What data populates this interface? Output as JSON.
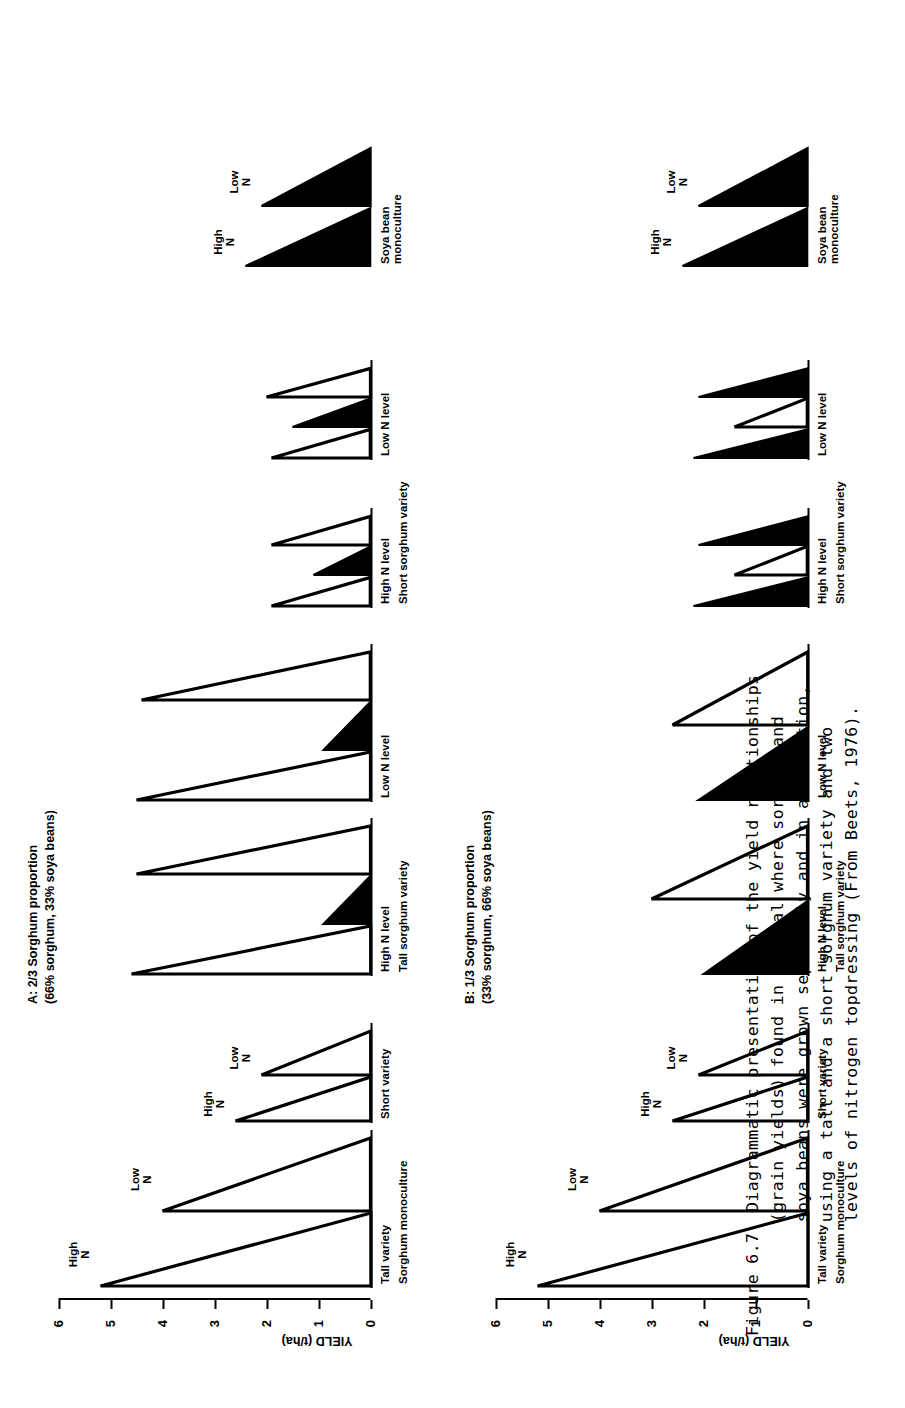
{
  "figure": {
    "number": "Figure 6.7",
    "caption_lines": [
      "Diagrammatic presentation of the yield relationships",
      "(grain yields) found in a trial where sorghum and",
      "soya beans were grown separately and in association,",
      "using a tall and a short sorghum variety and two",
      "levels of nitrogen topdressing (From Beets, 1976)."
    ]
  },
  "axis": {
    "title": "YIELD (t/ha)",
    "ticks": [
      "6",
      "5",
      "4",
      "3",
      "2",
      "1",
      "0"
    ],
    "min": 0,
    "max": 6
  },
  "nitrogen": {
    "high": "High\nN",
    "low": "Low\nN"
  },
  "panels": [
    {
      "id": "A",
      "title_line1": "A: 2/3 Sorghum proportion",
      "title_line2": "(66% sorghum, 33% soya beans)",
      "monoculture_label": "Sorghum monoculture",
      "soyabean_label": "Soya bean\nmonoculture",
      "clusters": [
        {
          "name": "sorghum-monoculture-tall",
          "label": "Tall variety",
          "group_label": "Sorghum monoculture",
          "bars": [
            {
              "crop": "sorghum",
              "n": "High",
              "value": 5.2,
              "fill": "open"
            },
            {
              "crop": "sorghum",
              "n": "Low",
              "value": 4.0,
              "fill": "open"
            }
          ]
        },
        {
          "name": "sorghum-monoculture-short",
          "label": "Short variety",
          "bars": [
            {
              "crop": "sorghum",
              "n": "High",
              "value": 2.6,
              "fill": "open"
            },
            {
              "crop": "sorghum",
              "n": "Low",
              "value": 2.1,
              "fill": "open"
            }
          ]
        },
        {
          "name": "tall-sorghum-high-n",
          "label": "High N level",
          "group_label": "Tall sorghum variety",
          "bars": [
            {
              "crop": "sorghum",
              "n": "High",
              "value": 4.6,
              "fill": "open"
            },
            {
              "crop": "soya",
              "n": "High",
              "value": 0.9,
              "fill": "solid"
            },
            {
              "crop": "sorghum",
              "n": "High",
              "value": 4.5,
              "fill": "open"
            }
          ]
        },
        {
          "name": "tall-sorghum-low-n",
          "label": "Low N level",
          "bars": [
            {
              "crop": "sorghum",
              "n": "Low",
              "value": 4.5,
              "fill": "open"
            },
            {
              "crop": "soya",
              "n": "Low",
              "value": 0.9,
              "fill": "solid"
            },
            {
              "crop": "sorghum",
              "n": "Low",
              "value": 4.4,
              "fill": "open"
            }
          ]
        },
        {
          "name": "short-sorghum-high-n",
          "label": "High N level",
          "group_label": "Short sorghum variety",
          "bars": [
            {
              "crop": "sorghum",
              "n": "High",
              "value": 1.9,
              "fill": "open"
            },
            {
              "crop": "soya",
              "n": "High",
              "value": 1.1,
              "fill": "solid"
            },
            {
              "crop": "sorghum",
              "n": "High",
              "value": 1.9,
              "fill": "open"
            }
          ]
        },
        {
          "name": "short-sorghum-low-n",
          "label": "Low N level",
          "bars": [
            {
              "crop": "sorghum",
              "n": "Low",
              "value": 1.9,
              "fill": "open"
            },
            {
              "crop": "soya",
              "n": "Low",
              "value": 1.5,
              "fill": "solid"
            },
            {
              "crop": "sorghum",
              "n": "Low",
              "value": 2.0,
              "fill": "open"
            }
          ]
        },
        {
          "name": "soya-bean-monoculture",
          "label": "Soya bean\nmonoculture",
          "bars": [
            {
              "crop": "soya",
              "n": "High",
              "value": 2.4,
              "fill": "solid"
            },
            {
              "crop": "soya",
              "n": "Low",
              "value": 2.1,
              "fill": "solid"
            }
          ]
        }
      ]
    },
    {
      "id": "B",
      "title_line1": "B: 1/3 Sorghum proportion",
      "title_line2": "(33% sorghum, 66% soya beans)",
      "monoculture_label": "Sorghum monoculture",
      "soyabean_label": "Soya bean\nmonoculture",
      "clusters": [
        {
          "name": "sorghum-monoculture-tall",
          "label": "Tall variety",
          "group_label": "Sorghum monoculture",
          "bars": [
            {
              "crop": "sorghum",
              "n": "High",
              "value": 5.2,
              "fill": "open"
            },
            {
              "crop": "sorghum",
              "n": "Low",
              "value": 4.0,
              "fill": "open"
            }
          ]
        },
        {
          "name": "sorghum-monoculture-short",
          "label": "Short variety",
          "bars": [
            {
              "crop": "sorghum",
              "n": "High",
              "value": 2.6,
              "fill": "open"
            },
            {
              "crop": "sorghum",
              "n": "Low",
              "value": 2.1,
              "fill": "open"
            }
          ]
        },
        {
          "name": "tall-sorghum-high-n",
          "label": "High N level",
          "group_label": "Tall sorghum variety",
          "bars": [
            {
              "crop": "soya",
              "n": "High",
              "value": 2.0,
              "fill": "solid"
            },
            {
              "crop": "sorghum",
              "n": "High",
              "value": 3.0,
              "fill": "open"
            }
          ]
        },
        {
          "name": "tall-sorghum-low-n",
          "label": "Low N level",
          "bars": [
            {
              "crop": "soya",
              "n": "Low",
              "value": 2.1,
              "fill": "solid"
            },
            {
              "crop": "sorghum",
              "n": "Low",
              "value": 2.6,
              "fill": "open"
            }
          ]
        },
        {
          "name": "short-sorghum-high-n",
          "label": "High N level",
          "group_label": "Short sorghum variety",
          "bars": [
            {
              "crop": "soya",
              "n": "High",
              "value": 2.2,
              "fill": "solid"
            },
            {
              "crop": "sorghum",
              "n": "High",
              "value": 1.4,
              "fill": "open"
            },
            {
              "crop": "soya",
              "n": "High",
              "value": 2.1,
              "fill": "solid"
            }
          ]
        },
        {
          "name": "short-sorghum-low-n",
          "label": "Low N level",
          "bars": [
            {
              "crop": "soya",
              "n": "Low",
              "value": 2.2,
              "fill": "solid"
            },
            {
              "crop": "sorghum",
              "n": "Low",
              "value": 1.4,
              "fill": "open"
            },
            {
              "crop": "soya",
              "n": "Low",
              "value": 2.1,
              "fill": "solid"
            }
          ]
        },
        {
          "name": "soya-bean-monoculture",
          "label": "Soya bean\nmonoculture",
          "bars": [
            {
              "crop": "soya",
              "n": "High",
              "value": 2.4,
              "fill": "solid"
            },
            {
              "crop": "soya",
              "n": "Low",
              "value": 2.1,
              "fill": "solid"
            }
          ]
        }
      ]
    }
  ],
  "chart_data": {
    "type": "bar",
    "ylabel": "YIELD (t/ha)",
    "xlabel": "",
    "ylim": [
      0,
      6
    ],
    "ytick_labels": [
      "0",
      "1",
      "2",
      "3",
      "4",
      "5",
      "6"
    ],
    "grid": false,
    "legend": [
      "open wedge = sorghum",
      "solid wedge = soya bean"
    ],
    "panels": [
      {
        "name": "A: 2/3 Sorghum proportion (66% sorghum, 33% soya beans)",
        "categories": [
          "Tall variety High N (mono)",
          "Tall variety Low N (mono)",
          "Short variety High N (mono)",
          "Short variety Low N (mono)",
          "Tall sorghum High N - sorghum",
          "Tall sorghum High N - soya",
          "Tall sorghum High N - sorghum 2",
          "Tall sorghum Low N - sorghum",
          "Tall sorghum Low N - soya",
          "Tall sorghum Low N - sorghum 2",
          "Short sorghum High N - sorghum",
          "Short sorghum High N - soya",
          "Short sorghum High N - sorghum 2",
          "Short sorghum Low N - sorghum",
          "Short sorghum Low N - soya",
          "Short sorghum Low N - sorghum 2",
          "Soya monoculture High N",
          "Soya monoculture Low N"
        ],
        "values": [
          5.2,
          4.0,
          2.6,
          2.1,
          4.6,
          0.9,
          4.5,
          4.5,
          0.9,
          4.4,
          1.9,
          1.1,
          1.9,
          1.9,
          1.5,
          2.0,
          2.4,
          2.1
        ]
      },
      {
        "name": "B: 1/3 Sorghum proportion (33% sorghum, 66% soya beans)",
        "categories": [
          "Tall variety High N (mono)",
          "Tall variety Low N (mono)",
          "Short variety High N (mono)",
          "Short variety Low N (mono)",
          "Tall sorghum High N - soya",
          "Tall sorghum High N - sorghum",
          "Tall sorghum Low N - soya",
          "Tall sorghum Low N - sorghum",
          "Short sorghum High N - soya",
          "Short sorghum High N - sorghum",
          "Short sorghum High N - soya 2",
          "Short sorghum Low N - soya",
          "Short sorghum Low N - sorghum",
          "Short sorghum Low N - soya 2",
          "Soya monoculture High N",
          "Soya monoculture Low N"
        ],
        "values": [
          5.2,
          4.0,
          2.6,
          2.1,
          2.0,
          3.0,
          2.1,
          2.6,
          2.2,
          1.4,
          2.1,
          2.2,
          1.4,
          2.1,
          2.4,
          2.1
        ]
      }
    ]
  }
}
